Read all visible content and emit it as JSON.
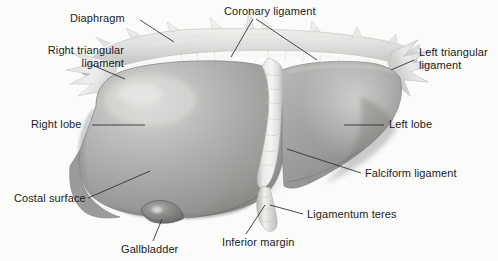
{
  "figure": {
    "width": 498,
    "height": 261,
    "background_color": "#fbfbfa",
    "style": "grayscale anatomical illustration"
  },
  "palette": {
    "text_color": "#1c1c1c",
    "leader_line_color": "#2b2b2b",
    "right_lobe_light": "#c9c9c9",
    "right_lobe_mid": "#a8a8a8",
    "right_lobe_dark": "#8e8e8e",
    "left_lobe_mid": "#9a9a9a",
    "left_lobe_dark": "#868686",
    "diaphragm_light": "#e4e4e2",
    "diaphragm_shadow": "#bdbdbb",
    "falciform_light": "#ededeb",
    "gallbladder_dark": "#7c7c7c",
    "outline": "#6f6f6f"
  },
  "labels": [
    {
      "id": "diaphragm",
      "text": "Diaphragm",
      "align": "left",
      "x": 70,
      "y": 12,
      "leader": [
        [
          140,
          20
        ],
        [
          174,
          42
        ]
      ]
    },
    {
      "id": "coronary-ligament",
      "text": "Coronary ligament",
      "align": "center",
      "x": 224,
      "y": 5,
      "leader_multi": [
        [
          [
            253,
            19
          ],
          [
            231,
            57
          ]
        ],
        [
          [
            256,
            19
          ],
          [
            317,
            60
          ]
        ]
      ]
    },
    {
      "id": "right-triangular-ligament",
      "text": "Right triangular\nligament",
      "align": "right",
      "x": 4,
      "y": 44,
      "leader": [
        [
          92,
          65
        ],
        [
          125,
          79
        ]
      ]
    },
    {
      "id": "left-triangular-ligament",
      "text": "Left triangular\nligament",
      "align": "left",
      "x": 419,
      "y": 46,
      "leader": [
        [
          414,
          60
        ],
        [
          391,
          70
        ]
      ]
    },
    {
      "id": "right-lobe",
      "text": "Right lobe",
      "align": "left",
      "x": 31,
      "y": 118,
      "leader": [
        [
          92,
          125
        ],
        [
          145,
          125
        ]
      ]
    },
    {
      "id": "left-lobe",
      "text": "Left lobe",
      "align": "left",
      "x": 389,
      "y": 118,
      "leader": [
        [
          384,
          125
        ],
        [
          344,
          125
        ]
      ]
    },
    {
      "id": "costal-surface",
      "text": "Costal surface",
      "align": "left",
      "x": 14,
      "y": 192,
      "leader": [
        [
          88,
          198
        ],
        [
          150,
          171
        ]
      ]
    },
    {
      "id": "falciform-ligament",
      "text": "Falciform ligament",
      "align": "left",
      "x": 365,
      "y": 167,
      "leader": [
        [
          361,
          173
        ],
        [
          287,
          149
        ]
      ]
    },
    {
      "id": "ligamentum-teres",
      "text": "Ligamentum teres",
      "align": "left",
      "x": 307,
      "y": 208,
      "leader": [
        [
          303,
          214
        ],
        [
          270,
          205
        ]
      ]
    },
    {
      "id": "inferior-margin",
      "text": "Inferior margin",
      "align": "left",
      "x": 222,
      "y": 236,
      "leader": [
        [
          246,
          234
        ],
        [
          265,
          205
        ]
      ]
    },
    {
      "id": "gallbladder",
      "text": "Gallbladder",
      "align": "left",
      "x": 121,
      "y": 243,
      "leader": [
        [
          153,
          241
        ],
        [
          162,
          219
        ]
      ]
    }
  ],
  "structures": [
    {
      "id": "diaphragm-band",
      "name": "diaphragm"
    },
    {
      "id": "coronary-ligament-band",
      "name": "coronary ligament"
    },
    {
      "id": "right-triangular-flap",
      "name": "right triangular ligament"
    },
    {
      "id": "left-triangular-flap",
      "name": "left triangular ligament"
    },
    {
      "id": "right-lobe-body",
      "name": "right lobe"
    },
    {
      "id": "left-lobe-body",
      "name": "left lobe"
    },
    {
      "id": "falciform-band",
      "name": "falciform ligament"
    },
    {
      "id": "ligamentum-teres-cord",
      "name": "ligamentum teres"
    },
    {
      "id": "gallbladder-fundus",
      "name": "gallbladder"
    },
    {
      "id": "inferior-margin-edge",
      "name": "inferior margin"
    }
  ]
}
